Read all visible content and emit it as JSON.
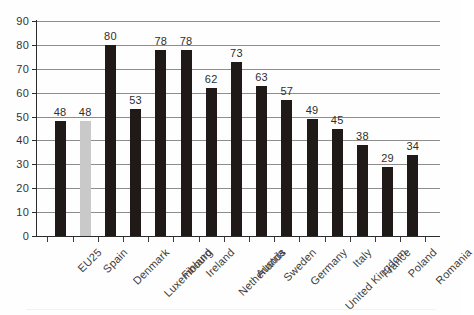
{
  "chart_data": {
    "type": "bar",
    "title": "",
    "subtitle": "",
    "xlabel": "",
    "ylabel": "",
    "ylim": [
      0,
      90
    ],
    "ytick_step": 10,
    "yticks": [
      90,
      80,
      70,
      60,
      50,
      40,
      30,
      20,
      10,
      0
    ],
    "grid": true,
    "legend": "none",
    "orientation": "vertical",
    "categories": [
      "EU25",
      "Spain",
      "Denmark",
      "Luxembourg",
      "Finland",
      "Ireland",
      "Netherlands",
      "Austria",
      "Sweden",
      "Germany",
      "United Kingdom",
      "Italy",
      "France",
      "Poland",
      "Romania"
    ],
    "values": [
      48,
      48,
      80,
      53,
      78,
      78,
      62,
      73,
      63,
      57,
      49,
      45,
      38,
      29,
      34
    ],
    "data_labels": [
      "48",
      "48",
      "80",
      "53",
      "78",
      "78",
      "62",
      "73",
      "63",
      "57",
      "49",
      "45",
      "38",
      "29",
      "34"
    ],
    "highlighted_categories": [
      "Spain"
    ],
    "colors": {
      "bar": "#1f1a17",
      "bar_highlight": "#c9c9c9",
      "gridline": "#8d8d8d",
      "axis": "#2b2b2b",
      "text": "#333333",
      "background": "#fefefe"
    }
  }
}
